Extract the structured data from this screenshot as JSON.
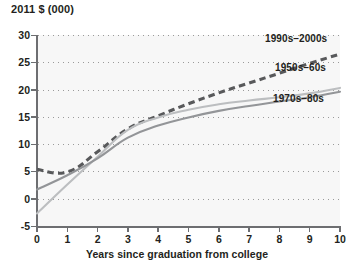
{
  "chart_data": {
    "type": "line",
    "title": "",
    "ylabel": "2011 $ (000)",
    "xlabel": "Years since graduation from college",
    "xlim": [
      0,
      10
    ],
    "ylim": [
      -5,
      30
    ],
    "xticks": [
      0,
      1,
      2,
      3,
      4,
      5,
      6,
      7,
      8,
      9,
      10
    ],
    "yticks": [
      -5,
      0,
      5,
      10,
      15,
      20,
      25,
      30
    ],
    "ytick_labels": [
      "-5",
      "0",
      "5",
      "10",
      "15",
      "20",
      "25",
      "30"
    ],
    "xtick_labels": [
      "0",
      "1",
      "2",
      "3",
      "4",
      "5",
      "6",
      "7",
      "8",
      "9",
      "10"
    ],
    "grid": "horizontal-dotted",
    "legend": "inline-annotations",
    "x": [
      0,
      1,
      2,
      3,
      4,
      5,
      6,
      7,
      8,
      9,
      10
    ],
    "series": [
      {
        "name": "1990s–2000s",
        "style": "dashed",
        "color": "#58595b",
        "values": [
          5.4,
          4.9,
          8.6,
          12.8,
          15.2,
          17.4,
          19.4,
          21.2,
          23.0,
          24.8,
          26.5
        ],
        "label_x": 10,
        "label_y": 29.3
      },
      {
        "name": "1950s–60s",
        "style": "solid",
        "color": "#bcbec0",
        "values": [
          -2.7,
          2.6,
          7.7,
          12.6,
          14.9,
          16.3,
          17.3,
          18.0,
          18.6,
          19.3,
          20.3
        ],
        "label_x": 10,
        "label_y": 23.8
      },
      {
        "name": "1970s–80s",
        "style": "solid",
        "color": "#939598",
        "values": [
          1.7,
          4.3,
          7.4,
          11.2,
          13.4,
          14.9,
          16.1,
          17.0,
          17.8,
          18.6,
          19.6
        ],
        "label_x": 10,
        "label_y": 18.0
      }
    ],
    "annotations": [
      {
        "text": "1990s–2000s",
        "left": 265,
        "top": 33
      },
      {
        "text": "1950s–60s",
        "left": 275,
        "top": 62
      },
      {
        "text": "1970s–80s",
        "left": 273,
        "top": 93
      }
    ],
    "colors": {
      "plot_background": "#f7f7f7",
      "axis": "#6d6e71",
      "grid": "#9a9a9a",
      "text": "#231f20"
    }
  }
}
